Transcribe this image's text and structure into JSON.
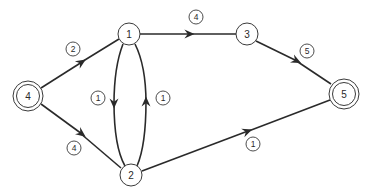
{
  "diagram": {
    "type": "directed-network",
    "colors": {
      "stroke": "#2a2a2a",
      "background": "#ffffff"
    },
    "nodes": [
      {
        "id": "4",
        "label": "4",
        "x": 28,
        "y": 96,
        "double": true,
        "role": "source"
      },
      {
        "id": "1",
        "label": "1",
        "x": 129,
        "y": 34,
        "double": false
      },
      {
        "id": "2",
        "label": "2",
        "x": 131,
        "y": 175,
        "double": false
      },
      {
        "id": "3",
        "label": "3",
        "x": 247,
        "y": 34,
        "double": false
      },
      {
        "id": "5",
        "label": "5",
        "x": 344,
        "y": 94,
        "double": true,
        "role": "sink"
      }
    ],
    "edges": [
      {
        "from": "4",
        "to": "1",
        "weight": "2",
        "label_x": 73,
        "label_y": 49
      },
      {
        "from": "4",
        "to": "2",
        "weight": "4",
        "label_x": 74,
        "label_y": 148
      },
      {
        "from": "1",
        "to": "3",
        "weight": "4",
        "label_x": 196,
        "label_y": 17
      },
      {
        "from": "1",
        "to": "2",
        "weight": "1",
        "label_x": 98,
        "label_y": 98,
        "curve": "left"
      },
      {
        "from": "2",
        "to": "1",
        "weight": "1",
        "label_x": 163,
        "label_y": 98,
        "curve": "right"
      },
      {
        "from": "3",
        "to": "5",
        "weight": "5",
        "label_x": 307,
        "label_y": 51
      },
      {
        "from": "2",
        "to": "5",
        "weight": "1",
        "label_x": 253,
        "label_y": 144
      }
    ]
  }
}
